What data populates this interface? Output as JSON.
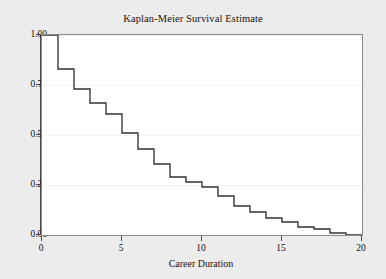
{
  "chart_data": {
    "type": "line",
    "title": "Kaplan-Meier Survival Estimate",
    "xlabel": "Career Duration",
    "ylabel": "",
    "xlim": [
      0,
      20
    ],
    "ylim": [
      0.0,
      1.0
    ],
    "grid": true,
    "legend": null,
    "step": "post",
    "line_color": "#333333",
    "x_ticks": [
      0,
      5,
      10,
      15,
      20
    ],
    "x_tick_labels": [
      "0",
      "5",
      "10",
      "15",
      "20"
    ],
    "y_ticks": [
      0.0,
      0.25,
      0.5,
      0.75,
      1.0
    ],
    "y_tick_labels": [
      "0.00",
      "0.25",
      "0.50",
      "0.75",
      "1.00"
    ],
    "x": [
      0,
      1,
      2,
      3,
      4,
      5,
      6,
      7,
      8,
      9,
      10,
      11,
      12,
      13,
      14,
      15,
      16,
      17,
      18,
      19,
      20
    ],
    "values": [
      1.0,
      0.83,
      0.73,
      0.66,
      0.605,
      0.51,
      0.43,
      0.355,
      0.29,
      0.265,
      0.24,
      0.195,
      0.145,
      0.115,
      0.085,
      0.065,
      0.04,
      0.03,
      0.01,
      0.0,
      0.0
    ],
    "series": [
      {
        "name": "Survival probability",
        "values": [
          1.0,
          0.83,
          0.73,
          0.66,
          0.605,
          0.51,
          0.43,
          0.355,
          0.29,
          0.265,
          0.24,
          0.195,
          0.145,
          0.115,
          0.085,
          0.065,
          0.04,
          0.03,
          0.01,
          0.0,
          0.0
        ]
      }
    ]
  },
  "figure": {
    "background_color": "#ececec",
    "panel_color": "#ffffff",
    "grid_color": "#f1f2f4",
    "axis_color": "#4a4a4a",
    "text_color": "#15110e"
  }
}
